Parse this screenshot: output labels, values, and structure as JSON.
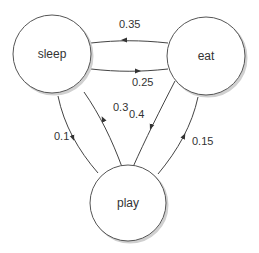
{
  "nodes": [
    {
      "id": "sleep",
      "label": "sleep"
    },
    {
      "id": "eat",
      "label": "eat"
    },
    {
      "id": "play",
      "label": "play"
    }
  ],
  "edges": [
    {
      "from": "eat",
      "to": "sleep",
      "label": "0.35"
    },
    {
      "from": "sleep",
      "to": "eat",
      "label": "0.25"
    },
    {
      "from": "sleep",
      "to": "play",
      "label": "0.1"
    },
    {
      "from": "play",
      "to": "sleep",
      "label": "0.3"
    },
    {
      "from": "eat",
      "to": "play",
      "label": "0.4"
    },
    {
      "from": "play",
      "to": "eat",
      "label": "0.15"
    }
  ],
  "colors": {
    "stroke": "#444444",
    "fill": "#ffffff",
    "text": "#333333"
  }
}
